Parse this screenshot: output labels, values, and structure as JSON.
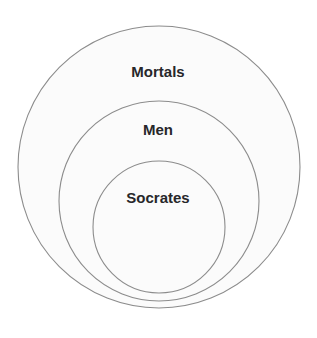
{
  "diagram": {
    "type": "euler-diagram",
    "background_color": "#ffffff",
    "sets": [
      {
        "id": "mortals",
        "label": "Mortals",
        "level": 0,
        "cx": 159,
        "cy": 167,
        "r": 141,
        "fill": "#fbfbfb",
        "stroke": "#8c8c8c",
        "stroke_width": 1.1,
        "label_x": 158,
        "label_y": 73,
        "label_size": 15,
        "label_color": "#27272a"
      },
      {
        "id": "men",
        "label": "Men",
        "level": 1,
        "cx": 159,
        "cy": 201,
        "r": 100,
        "fill": "#fbfbfb",
        "stroke": "#8c8c8c",
        "stroke_width": 1.1,
        "label_x": 158,
        "label_y": 131,
        "label_size": 15,
        "label_color": "#27272a"
      },
      {
        "id": "socrates",
        "label": "Socrates",
        "level": 2,
        "cx": 159,
        "cy": 227,
        "r": 66,
        "fill": "#fbfbfb",
        "stroke": "#8c8c8c",
        "stroke_width": 1.1,
        "label_x": 158,
        "label_y": 199,
        "label_size": 15,
        "label_color": "#27272a"
      }
    ]
  }
}
